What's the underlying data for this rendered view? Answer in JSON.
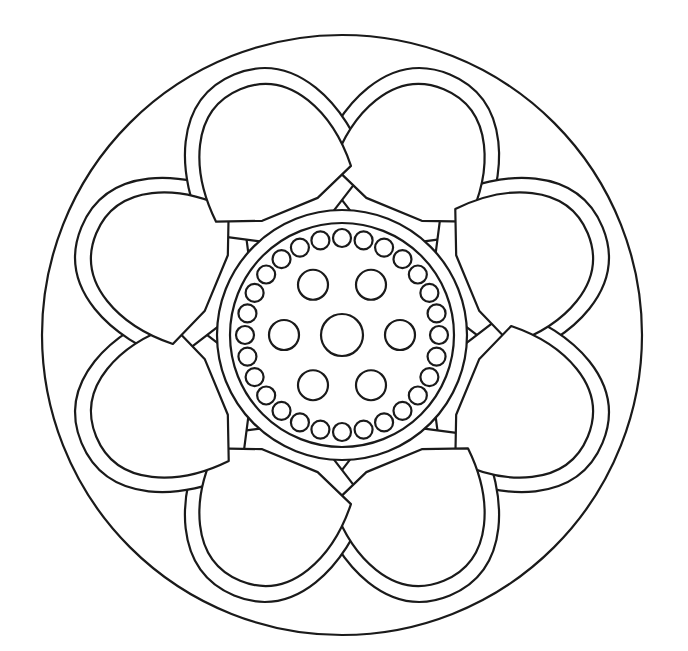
{
  "artwork": {
    "subject": "mandala-flower-coloring-page",
    "center": [
      342,
      335
    ],
    "outer_circle_radius": 300,
    "petal_count": 8,
    "petal_rotation_offset_deg": 22.5,
    "center_ring_outer_radius": 125,
    "center_ring_inner_radius": 112,
    "dot_ring_count": 28,
    "dot_ring_radius": 97,
    "dot_radius": 9,
    "inner_circle_count": 6,
    "inner_circle_radius": 15,
    "inner_circle_distance": 58,
    "center_circle_radius": 21,
    "line_color": "#1a1a1a",
    "fill_color": "#ffffff"
  }
}
